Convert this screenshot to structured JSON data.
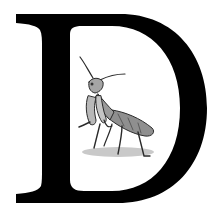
{
  "image": {
    "letter": "D",
    "description": "Decorative drop-cap letter with praying mantis illustration",
    "colors": {
      "background": "#ffffff",
      "letter": "#000000",
      "mantis_body": "#8a8a8a",
      "mantis_dark": "#3a3a3a",
      "mantis_light": "#c8c8c8",
      "shadow": "#bdbdbd"
    }
  }
}
